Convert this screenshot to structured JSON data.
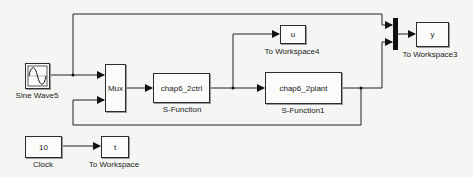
{
  "diagram": {
    "type": "simulink-model",
    "background": "#f5f5f3",
    "line_color": "#222222",
    "blocks": [
      {
        "id": "sine",
        "kind": "sine-wave",
        "text": "",
        "label": "Sine Wave5"
      },
      {
        "id": "mux",
        "kind": "mux",
        "text": "Mux",
        "label": ""
      },
      {
        "id": "ctrl",
        "kind": "s-function",
        "text": "chap6_2ctrl",
        "label": "S-Function"
      },
      {
        "id": "u",
        "kind": "to-workspace",
        "text": "u",
        "label": "To Workspace4"
      },
      {
        "id": "plant",
        "kind": "s-function",
        "text": "chap6_2plant",
        "label": "S-Function1"
      },
      {
        "id": "bus",
        "kind": "mux-bar",
        "text": "",
        "label": ""
      },
      {
        "id": "y",
        "kind": "to-workspace",
        "text": "y",
        "label": "To Workspace3"
      },
      {
        "id": "clock",
        "kind": "clock",
        "text": "10",
        "label": "Clock"
      },
      {
        "id": "t",
        "kind": "to-workspace",
        "text": "t",
        "label": "To Workspace"
      }
    ],
    "connections": [
      {
        "from": "sine",
        "to": "mux",
        "port": 1
      },
      {
        "from": "sine",
        "to": "bus",
        "port": 1
      },
      {
        "from": "mux",
        "to": "ctrl"
      },
      {
        "from": "ctrl",
        "to": "u"
      },
      {
        "from": "ctrl",
        "to": "plant"
      },
      {
        "from": "plant",
        "to": "bus",
        "port": 2
      },
      {
        "from": "plant",
        "to": "mux",
        "port": 2
      },
      {
        "from": "bus",
        "to": "y"
      },
      {
        "from": "clock",
        "to": "t"
      }
    ]
  }
}
